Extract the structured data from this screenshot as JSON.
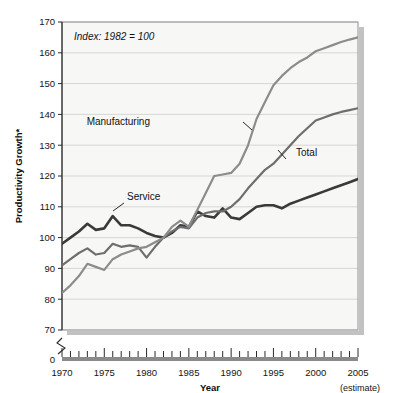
{
  "chart_data": {
    "type": "line",
    "title": "",
    "annotation": "Index: 1982 = 100",
    "xlabel": "Year",
    "ylabel": "Productivity Growth*",
    "footnote": "* Nonfarm",
    "estimate_note": "(estimate)",
    "xlim": [
      1970,
      2005
    ],
    "ylim": [
      70,
      170
    ],
    "y_axis_break": true,
    "y_break_label": "0",
    "grid": true,
    "legend": "inline-labels",
    "yticks": [
      70,
      80,
      90,
      100,
      110,
      120,
      130,
      140,
      150,
      160,
      170
    ],
    "ytick_labels": [
      "70",
      "80",
      "90",
      "100",
      "110",
      "120",
      "130",
      "140",
      "150",
      "160",
      "170"
    ],
    "xticks": [
      1970,
      1975,
      1980,
      1985,
      1990,
      1995,
      2000,
      2005
    ],
    "xtick_labels": [
      "1970",
      "1975",
      "1980",
      "1985",
      "1990",
      "1995",
      "2000",
      "2005"
    ],
    "x_minor_tick_interval": 1,
    "x": [
      1970,
      1971,
      1972,
      1973,
      1974,
      1975,
      1976,
      1977,
      1978,
      1979,
      1980,
      1981,
      1982,
      1983,
      1984,
      1985,
      1986,
      1987,
      1988,
      1989,
      1990,
      1991,
      1992,
      1993,
      1994,
      1995,
      1996,
      1997,
      1998,
      1999,
      2000,
      2001,
      2002,
      2003,
      2004,
      2005
    ],
    "series": [
      {
        "name": "Service",
        "color": "#3a3a3a",
        "width": 2.6,
        "label_position": "1977, 108",
        "values": [
          98,
          100,
          102,
          104.5,
          102.5,
          103,
          107,
          104,
          104,
          103,
          101.5,
          100.5,
          100,
          101.5,
          104,
          103.5,
          108.5,
          107,
          106.5,
          109.5,
          106.5,
          106,
          108,
          110,
          110.5,
          110.5,
          109.5,
          111,
          112,
          113,
          114,
          115,
          116,
          117,
          118,
          119
        ]
      },
      {
        "name": "Total",
        "color": "#6e6e6e",
        "width": 2.2,
        "label_position": "1996, 125",
        "values": [
          91,
          93,
          95,
          96.5,
          94.5,
          95,
          98,
          97,
          97.5,
          97,
          93.5,
          97,
          100,
          102,
          103.5,
          103,
          106.5,
          108,
          108.5,
          108.5,
          110,
          112.5,
          116,
          119,
          122,
          124,
          127,
          130,
          133,
          135.5,
          138,
          139,
          140,
          140.8,
          141.4,
          142
        ]
      },
      {
        "name": "Manufacturing",
        "color": "#8c8c8c",
        "width": 2.2,
        "label_position": "1983, 137",
        "values": [
          82,
          84.5,
          87.5,
          91.5,
          90.5,
          89.5,
          93,
          94.5,
          95.5,
          96.5,
          97,
          98.5,
          100,
          103.5,
          105.5,
          103.5,
          109,
          114.5,
          120,
          120.5,
          121,
          124,
          130,
          138.5,
          144,
          149.5,
          152.5,
          155,
          157,
          158.5,
          160.5,
          161.5,
          162.5,
          163.5,
          164.3,
          165
        ]
      }
    ]
  }
}
